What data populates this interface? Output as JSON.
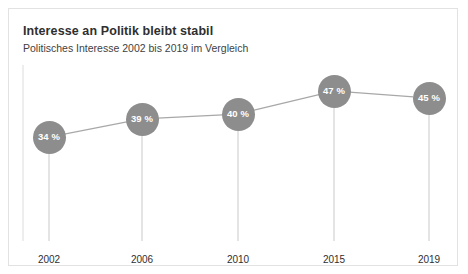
{
  "header": {
    "title": "Interesse an Politik bleibt stabil",
    "subtitle": "Politisches Interesse 2002 bis 2019 im Vergleich"
  },
  "colors": {
    "marker": "#8d8d8d",
    "line": "#a8a8a8",
    "drop_line": "#c9c9c9",
    "axis": "#dcdcdc",
    "border": "#e2e2e2",
    "title_text": "#2f2f2f",
    "marker_text": "#ffffff",
    "background": "#ffffff"
  },
  "chart_data": {
    "type": "line",
    "title": "Interesse an Politik bleibt stabil",
    "subtitle": "Politisches Interesse 2002 bis 2019 im Vergleich",
    "xlabel": "",
    "ylabel": "",
    "categories": [
      "2002",
      "2006",
      "2010",
      "2015",
      "2019"
    ],
    "values": [
      34,
      39,
      40,
      47,
      45
    ],
    "value_labels": [
      "34 %",
      "39 %",
      "40 %",
      "47 %",
      "45 %"
    ],
    "unit": "%",
    "ylim": [
      0,
      55
    ],
    "grid": false,
    "legend": null,
    "series": [
      {
        "name": "Politisches Interesse",
        "values": [
          34,
          39,
          40,
          47,
          45
        ]
      }
    ],
    "points": [
      {
        "category": "2002",
        "value": 34,
        "label": "34 %",
        "cx": 40,
        "cy": 128
      },
      {
        "category": "2006",
        "value": 39,
        "label": "39 %",
        "cx": 133,
        "cy": 110
      },
      {
        "category": "2010",
        "value": 40,
        "label": "40 %",
        "cx": 229,
        "cy": 105
      },
      {
        "category": "2015",
        "value": 47,
        "label": "47 %",
        "cx": 325,
        "cy": 82
      },
      {
        "category": "2019",
        "value": 45,
        "label": "45 %",
        "cx": 420,
        "cy": 89
      }
    ]
  }
}
